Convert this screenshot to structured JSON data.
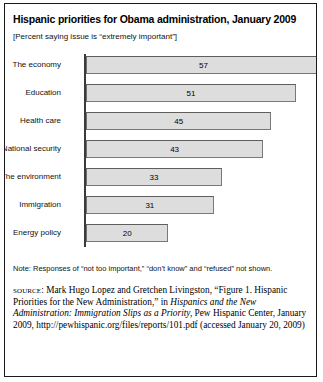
{
  "chart_data": {
    "type": "bar",
    "orientation": "horizontal",
    "title": "Hispanic priorities for Obama administration, January 2009",
    "subtitle": "[Percent saying issue is “extremely important”]",
    "categories": [
      "The economy",
      "Education",
      "Health care",
      "National security",
      "The environment",
      "Immigration",
      "Energy policy"
    ],
    "values": [
      57,
      51,
      45,
      43,
      33,
      31,
      20
    ],
    "xlabel": "",
    "ylabel": "",
    "xlim": [
      0,
      60
    ],
    "grid": false,
    "legend": false,
    "bar_fill_color": "#dddddd",
    "bar_border_color": "#787878",
    "axis_color": "#3b3b3b"
  },
  "note": "Note: Responses of “not too important,” “don’t know” and “refused” not shown.",
  "source": {
    "label": "source:",
    "part1": " Mark Hugo Lopez and Gretchen Livingston, “Figure 1. Hispanic Priorities for the New Administration,” in ",
    "italic": "Hispanics and the New Administration: Immigration Slips as a Priority,",
    "part2": " Pew Hispanic Center, January 2009, http://pewhispanic.org/files/reports/101.pdf (accessed January 20, 2009)"
  }
}
